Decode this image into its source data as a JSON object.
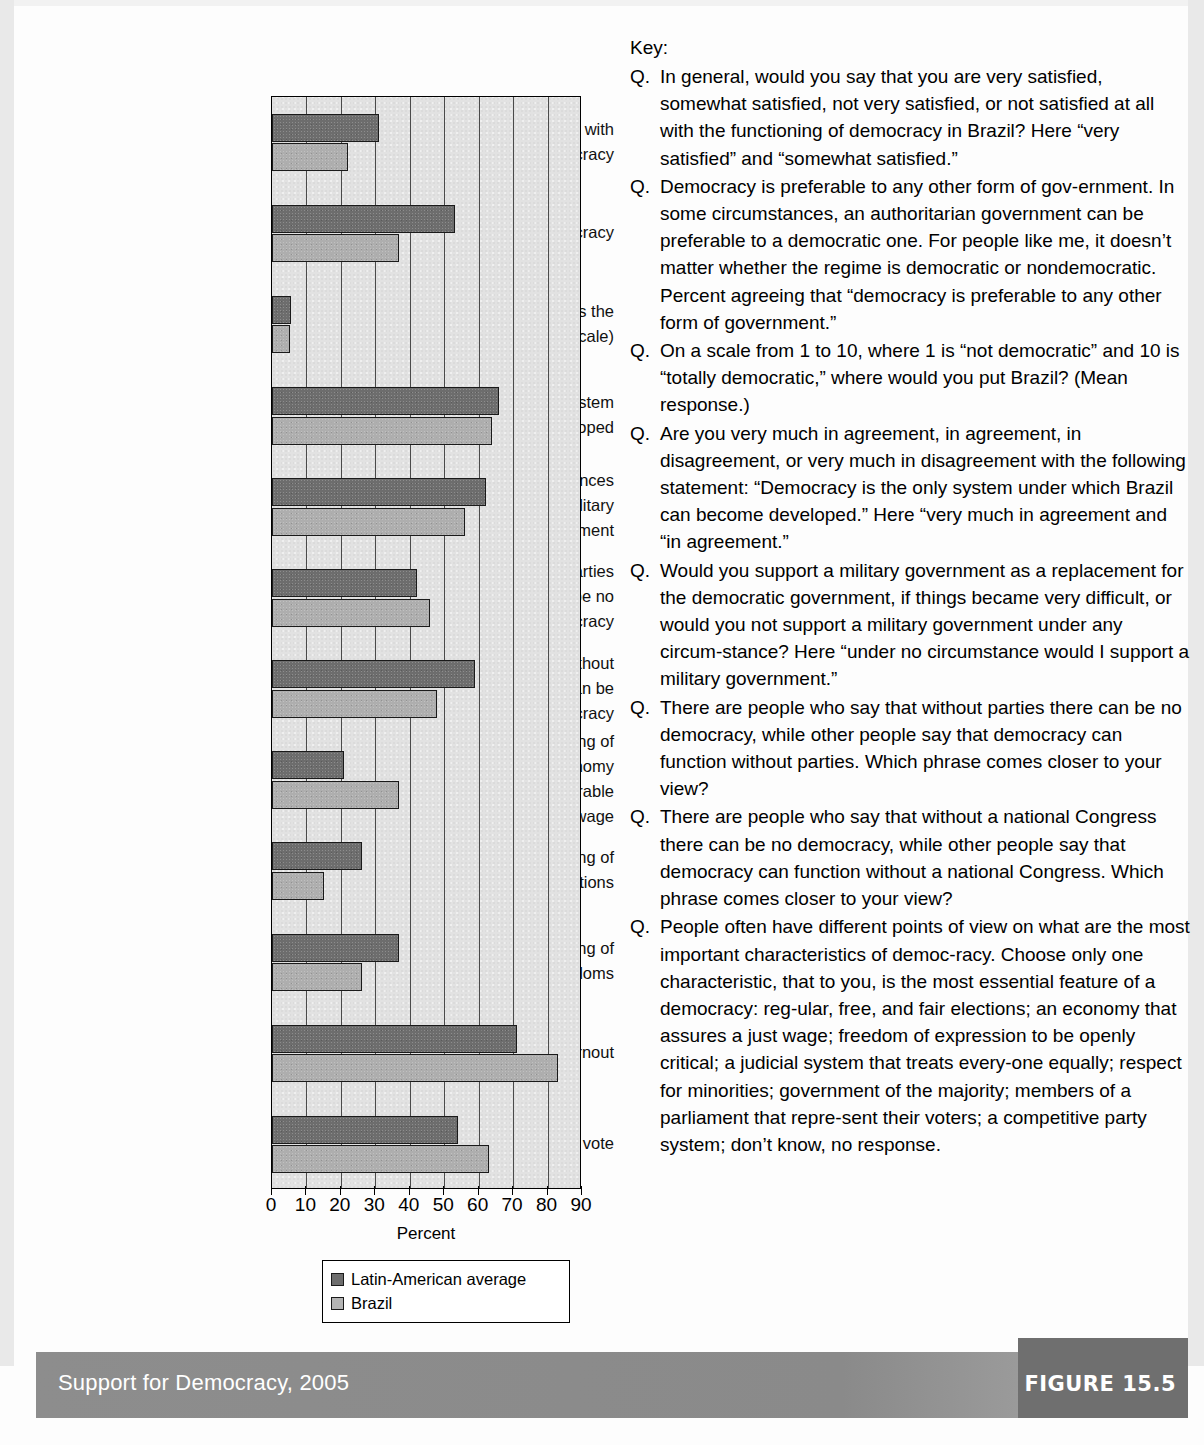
{
  "figure": {
    "footer_title": "Support for Democracy, 2005",
    "figure_label": "FIGURE 15.5"
  },
  "key": {
    "title": "Key:",
    "marker": "Q.",
    "items": [
      "In general, would you say that you are very satisfied, somewhat satisfied, not very satisfied, or not satisfied at all with the functioning of democracy in Brazil? Here “very satisfied” and “somewhat satisfied.”",
      "Democracy is preferable to any other form of gov-ernment. In some circumstances, an authoritarian government can be preferable to a democratic one. For people like me, it doesn’t matter whether the regime is democratic or nondemocratic. Percent agreeing that “democracy is preferable to any other form of government.”",
      "On a scale from 1 to 10, where 1 is “not democratic” and 10 is “totally democratic,” where would you put Brazil? (Mean response.)",
      "Are you very much in agreement, in agreement, in disagreement, or very much in disagreement with the following statement: “Democracy is the only system under which Brazil can become developed.” Here “very much in agreement and “in agreement.”",
      "Would you support a military government as a replacement for the democratic government, if things became very difficult, or would you not support a military government under any circum-stance? Here “under no circumstance would I support a military government.”",
      "There are people who say that without parties there can be no democracy, while other people say that democracy can function without parties. Which phrase comes closer to your view?",
      "There are people who say that without a national Congress there can be no democracy, while other people say that democracy can function without a national Congress. Which phrase comes closer to your view?",
      "People often have different points of view on what are the most important characteristics of democ-racy. Choose only one characteristic, that to you, is the most essential feature of a democracy: reg-ular, free, and fair elections; an economy that assures a just wage; freedom of expression to be openly critical; a judicial system that treats every-one equally; respect for minorities; government of the majority; members of a parliament that repre-sent their voters; a competitive party system; don’t know, no response."
    ]
  },
  "chart_data": {
    "type": "bar",
    "orientation": "horizontal",
    "title": "Support for Democracy, 2005",
    "xlabel": "Percent",
    "ylabel": "",
    "xlim": [
      0,
      90
    ],
    "xticks": [
      0,
      10,
      20,
      30,
      40,
      50,
      60,
      70,
      80,
      90
    ],
    "grid": true,
    "legend_position": "bottom",
    "categories": [
      "Satisfaction with democracy",
      "Support for democracy",
      "How democratic is the country? (1–10 scale)",
      "Democracy as system to become developed",
      "Under no circumstances would support a military government",
      "View that without parties there can be no democracy",
      "View that without Congress there can be no democracy",
      "Principal meaning of democracy—economy that assures honorable wage",
      "Principal meaning of democracy—elections",
      "Principal meaning of democracy—freedoms",
      "Voter turnout",
      "Efficacy of vote"
    ],
    "category_lines": [
      [
        "Satisfaction with",
        "democracy"
      ],
      [
        "Support for democracy"
      ],
      [
        "How democratic is the",
        "country? (1–10 scale)"
      ],
      [
        "Democracy as system",
        "to become developed"
      ],
      [
        "Under no circumstances",
        "would support a military",
        "government"
      ],
      [
        "View that without parties",
        "there can be no",
        "democracy"
      ],
      [
        "View that without",
        "Congress there can be",
        "no democracy"
      ],
      [
        "Principal meaning of",
        "democracy—economy",
        "that assures honorable",
        "wage"
      ],
      [
        "Principal meaning of",
        "democracy—elections"
      ],
      [
        "Principal meaning of",
        "democracy—freedoms"
      ],
      [
        "Voter turnout"
      ],
      [
        "Efficacy of vote"
      ]
    ],
    "series": [
      {
        "name": "Latin-American average",
        "color": "#6d6d6d",
        "values": [
          31,
          53,
          5.5,
          66,
          62,
          42,
          59,
          21,
          26,
          37,
          71,
          54
        ]
      },
      {
        "name": "Brazil",
        "color": "#b4b4b4",
        "values": [
          22,
          37,
          5.3,
          64,
          56,
          46,
          48,
          37,
          15,
          26,
          83,
          63
        ]
      }
    ]
  }
}
